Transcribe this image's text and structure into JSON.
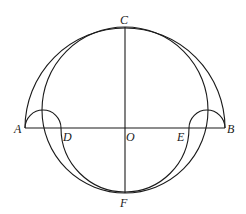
{
  "figure": {
    "points": {
      "A": {
        "label": "A",
        "x": 25,
        "y": 128
      },
      "B": {
        "label": "B",
        "x": 225,
        "y": 128
      },
      "O": {
        "label": "O",
        "x": 125,
        "y": 128
      },
      "C": {
        "label": "C",
        "x": 125,
        "y": 27
      },
      "F": {
        "label": "F",
        "x": 125,
        "y": 193
      },
      "D": {
        "label": "D",
        "x": 61,
        "y": 128
      },
      "E": {
        "label": "E",
        "x": 189,
        "y": 128
      }
    },
    "labels": {
      "A": "A",
      "B": "B",
      "C": "C",
      "D": "D",
      "E": "E",
      "F": "F",
      "O": "O"
    },
    "colors": {
      "stroke": "#1a1a1a",
      "background": "#ffffff"
    }
  }
}
